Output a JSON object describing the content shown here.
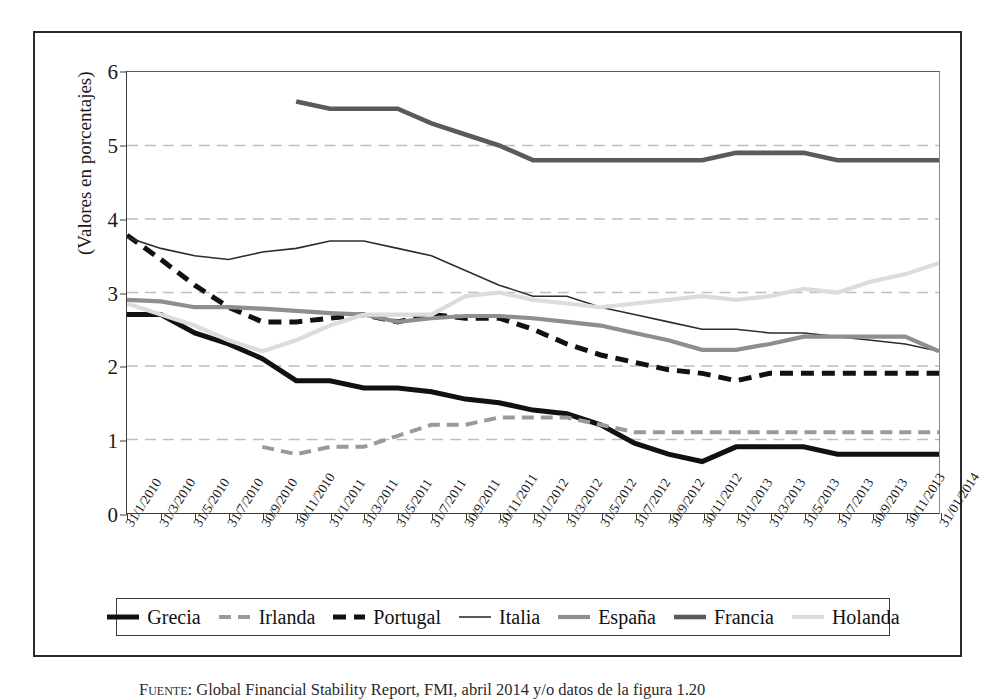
{
  "figure": {
    "caption_label": "Fuente:",
    "caption_text": "Global Financial Stability Report, FMI, abril 2014 y/o datos de la figura 1.20"
  },
  "axes": {
    "y_title": "(Valores en porcentajes)",
    "y_ticks": [
      "0",
      "1",
      "2",
      "3",
      "4",
      "5",
      "6"
    ],
    "x_ticks": [
      "31/1/2010",
      "31/3/2010",
      "31/5/2010",
      "31/7/2010",
      "30/9/2010",
      "30/11/2010",
      "31/1/2011",
      "31/3/2011",
      "31/5/2011",
      "31/7/2011",
      "30/9/2011",
      "30/11/2011",
      "31/1/2012",
      "31/3/2012",
      "31/5/2012",
      "31/7/2012",
      "30/9/2012",
      "30/11/2012",
      "31/1/2013",
      "31/3/2013",
      "31/5/2013",
      "31/7/2013",
      "30/9/2013",
      "30/11/2013",
      "31/01/2014"
    ]
  },
  "legend": {
    "position": "bottom",
    "items": [
      {
        "label": "Grecia",
        "color": "#111111",
        "width": 5.0,
        "dash": "none"
      },
      {
        "label": "Irlanda",
        "color": "#9a9a9a",
        "width": 4.0,
        "dash": "12,7"
      },
      {
        "label": "Portugal",
        "color": "#111111",
        "width": 5.0,
        "dash": "13,8"
      },
      {
        "label": "Italia",
        "color": "#2d2d2d",
        "width": 1.6,
        "dash": "none"
      },
      {
        "label": "España",
        "color": "#8e8e8e",
        "width": 4.2,
        "dash": "none"
      },
      {
        "label": "Francia",
        "color": "#5a5a5a",
        "width": 4.6,
        "dash": "none"
      },
      {
        "label": "Holanda",
        "color": "#dcdcdc",
        "width": 4.2,
        "dash": "none"
      }
    ]
  },
  "chart_data": {
    "type": "line",
    "title": "",
    "xlabel": "",
    "ylabel": "(Valores en porcentajes)",
    "ylim": [
      0,
      6
    ],
    "grid": "horizontal-dashed",
    "grid_values": [
      1,
      2,
      3,
      4,
      5
    ],
    "x": [
      "31/1/2010",
      "31/3/2010",
      "31/5/2010",
      "31/7/2010",
      "30/9/2010",
      "30/11/2010",
      "31/1/2011",
      "31/3/2011",
      "31/5/2011",
      "31/7/2011",
      "30/9/2011",
      "30/11/2011",
      "31/1/2012",
      "31/3/2012",
      "31/5/2012",
      "31/7/2012",
      "30/9/2012",
      "30/11/2012",
      "31/1/2013",
      "31/3/2013",
      "31/5/2013",
      "31/7/2013",
      "30/9/2013",
      "30/11/2013",
      "31/01/2014"
    ],
    "series": [
      {
        "name": "Grecia",
        "color": "#111111",
        "width": 5.0,
        "dash": "none",
        "values": [
          2.7,
          2.7,
          2.45,
          2.3,
          2.1,
          1.8,
          1.8,
          1.7,
          1.7,
          1.65,
          1.55,
          1.5,
          1.4,
          1.35,
          1.2,
          0.95,
          0.8,
          0.7,
          0.9,
          0.9,
          0.9,
          0.8,
          0.8,
          0.8,
          0.8
        ]
      },
      {
        "name": "Irlanda",
        "color": "#9a9a9a",
        "width": 4.0,
        "dash": "12,7",
        "values": [
          null,
          null,
          null,
          null,
          0.9,
          0.8,
          0.9,
          0.9,
          1.05,
          1.2,
          1.2,
          1.3,
          1.3,
          1.3,
          1.2,
          1.1,
          1.1,
          1.1,
          1.1,
          1.1,
          1.1,
          1.1,
          1.1,
          1.1,
          1.1
        ]
      },
      {
        "name": "Portugal",
        "color": "#111111",
        "width": 5.0,
        "dash": "13,8",
        "values": [
          3.78,
          3.45,
          3.1,
          2.8,
          2.6,
          2.6,
          2.65,
          2.7,
          2.6,
          2.7,
          2.65,
          2.65,
          2.5,
          2.3,
          2.15,
          2.05,
          1.95,
          1.9,
          1.8,
          1.9,
          1.9,
          1.9,
          1.9,
          1.9,
          1.9
        ]
      },
      {
        "name": "Italia",
        "color": "#2d2d2d",
        "width": 1.6,
        "dash": "none",
        "values": [
          3.75,
          3.6,
          3.5,
          3.45,
          3.55,
          3.6,
          3.7,
          3.7,
          3.6,
          3.5,
          3.3,
          3.1,
          2.95,
          2.95,
          2.8,
          2.7,
          2.6,
          2.5,
          2.5,
          2.45,
          2.45,
          2.4,
          2.35,
          2.3,
          2.2
        ]
      },
      {
        "name": "España",
        "color": "#8e8e8e",
        "width": 4.2,
        "dash": "none",
        "values": [
          2.9,
          2.88,
          2.8,
          2.8,
          2.78,
          2.75,
          2.72,
          2.7,
          2.6,
          2.65,
          2.68,
          2.68,
          2.65,
          2.6,
          2.55,
          2.45,
          2.35,
          2.22,
          2.22,
          2.3,
          2.4,
          2.4,
          2.4,
          2.4,
          2.2
        ]
      },
      {
        "name": "Francia",
        "color": "#5a5a5a",
        "width": 4.6,
        "dash": "none",
        "values": [
          null,
          null,
          null,
          null,
          null,
          5.6,
          5.5,
          5.5,
          5.5,
          5.3,
          5.15,
          5.0,
          4.8,
          4.8,
          4.8,
          4.8,
          4.8,
          4.8,
          4.9,
          4.9,
          4.9,
          4.8,
          4.8,
          4.8,
          4.8
        ]
      },
      {
        "name": "Holanda",
        "color": "#dcdcdc",
        "width": 4.2,
        "dash": "none",
        "values": [
          2.85,
          2.7,
          2.55,
          2.35,
          2.2,
          2.35,
          2.55,
          2.7,
          2.7,
          2.7,
          2.95,
          3.0,
          2.9,
          2.85,
          2.8,
          2.85,
          2.9,
          2.95,
          2.9,
          2.95,
          3.05,
          3.0,
          3.15,
          3.25,
          3.4
        ]
      }
    ]
  }
}
